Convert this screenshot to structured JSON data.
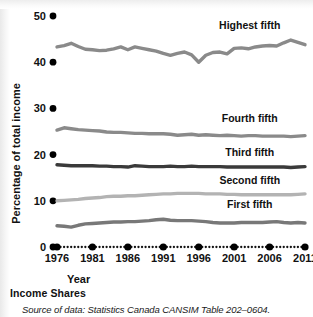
{
  "chart_data": {
    "type": "line",
    "title": "Income Shares",
    "xlabel": "Year",
    "ylabel": "Percentage of total income",
    "source": "Source of data: Statistics Canada CANSIM Table 202–0604.",
    "grid": false,
    "legend_position": "inline-right",
    "xlim": [
      1976,
      2011
    ],
    "ylim": [
      0,
      50
    ],
    "yticks": [
      0,
      10,
      20,
      30,
      40,
      50
    ],
    "ytick_labels": [
      "0",
      "10",
      "20",
      "30",
      "40",
      "50"
    ],
    "xticks": [
      1976,
      1981,
      1986,
      1991,
      1996,
      2001,
      2006,
      2011
    ],
    "xtick_labels": [
      "1976",
      "1981",
      "1986",
      "1991",
      "1996",
      "2001",
      "2006",
      "2011"
    ],
    "x": [
      1976,
      1977,
      1978,
      1979,
      1980,
      1981,
      1982,
      1983,
      1984,
      1985,
      1986,
      1987,
      1988,
      1989,
      1990,
      1991,
      1992,
      1993,
      1994,
      1995,
      1996,
      1997,
      1998,
      1999,
      2000,
      2001,
      2002,
      2003,
      2004,
      2005,
      2006,
      2007,
      2008,
      2009,
      2010,
      2011
    ],
    "series": [
      {
        "name": "Highest fifth",
        "color": "#8a8a8a",
        "label_x": 2003.2,
        "label_y": 47.2,
        "values": [
          43.3,
          43.6,
          44.1,
          43.4,
          42.8,
          42.7,
          42.5,
          42.6,
          42.9,
          43.3,
          42.7,
          43.3,
          43.0,
          42.7,
          42.4,
          41.9,
          41.5,
          41.9,
          42.2,
          41.6,
          40.0,
          41.5,
          42.1,
          42.2,
          41.8,
          43.0,
          43.1,
          42.9,
          43.3,
          43.5,
          43.6,
          43.5,
          44.2,
          44.8,
          44.3,
          43.8
        ]
      },
      {
        "name": "Fourth fifth",
        "color": "#8a8a8a",
        "label_x": 2003.2,
        "label_y": 27.1,
        "values": [
          25.3,
          25.8,
          25.6,
          25.4,
          25.3,
          25.2,
          25.1,
          24.9,
          24.8,
          24.8,
          24.7,
          24.6,
          24.6,
          24.5,
          24.5,
          24.5,
          24.4,
          24.2,
          24.3,
          24.4,
          24.2,
          24.3,
          24.2,
          24.1,
          24.2,
          24.1,
          24.0,
          24.1,
          24.1,
          24.0,
          24.0,
          24.0,
          24.0,
          23.9,
          24.0,
          24.1
        ]
      },
      {
        "name": "Third fifth",
        "color": "#3a3a3a",
        "label_x": 2003.2,
        "label_y": 19.6,
        "values": [
          17.8,
          17.7,
          17.6,
          17.6,
          17.6,
          17.6,
          17.5,
          17.5,
          17.4,
          17.4,
          17.3,
          17.6,
          17.5,
          17.4,
          17.4,
          17.4,
          17.5,
          17.4,
          17.4,
          17.5,
          17.4,
          17.4,
          17.4,
          17.4,
          17.3,
          17.3,
          17.3,
          17.3,
          17.3,
          17.3,
          17.3,
          17.3,
          17.3,
          17.2,
          17.3,
          17.4
        ]
      },
      {
        "name": "Second fifth",
        "color": "#b3b3b3",
        "label_x": 2003.2,
        "label_y": 13.6,
        "values": [
          10.0,
          10.1,
          10.2,
          10.3,
          10.5,
          10.6,
          10.7,
          10.9,
          11.0,
          11.0,
          11.1,
          11.1,
          11.2,
          11.3,
          11.4,
          11.5,
          11.5,
          11.6,
          11.6,
          11.6,
          11.6,
          11.5,
          11.5,
          11.5,
          11.4,
          11.4,
          11.3,
          11.3,
          11.3,
          11.3,
          11.3,
          11.3,
          11.3,
          11.3,
          11.4,
          11.5
        ]
      },
      {
        "name": "First fifth",
        "color": "#787878",
        "label_x": 2003.2,
        "label_y": 8.4,
        "values": [
          4.6,
          4.5,
          4.3,
          4.7,
          5.0,
          5.1,
          5.2,
          5.3,
          5.4,
          5.4,
          5.5,
          5.5,
          5.6,
          5.7,
          5.9,
          6.0,
          5.8,
          5.7,
          5.7,
          5.7,
          5.6,
          5.5,
          5.3,
          5.2,
          5.2,
          5.2,
          5.3,
          5.3,
          5.3,
          5.3,
          5.4,
          5.5,
          5.3,
          5.2,
          5.3,
          5.2
        ]
      }
    ]
  }
}
